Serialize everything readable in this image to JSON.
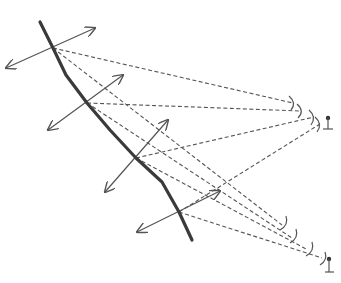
{
  "diagram": {
    "type": "ray-diagram",
    "colors": {
      "surface": "#3a3a3a",
      "rays": "#555555",
      "background": "#ffffff"
    },
    "surface": {
      "points": [
        [
          40,
          22
        ],
        [
          53,
          48
        ],
        [
          66,
          75
        ],
        [
          87,
          103
        ],
        [
          110,
          130
        ],
        [
          136,
          158
        ],
        [
          162,
          182
        ],
        [
          179,
          212
        ],
        [
          192,
          240
        ]
      ]
    },
    "source_points": [
      {
        "id": "p1",
        "x": 53,
        "y": 48,
        "arrow_a": [
          95,
          28
        ],
        "arrow_b": [
          6,
          68
        ]
      },
      {
        "id": "p2",
        "x": 87,
        "y": 103,
        "arrow_a": [
          123,
          75
        ],
        "arrow_b": [
          48,
          130
        ]
      },
      {
        "id": "p3",
        "x": 136,
        "y": 158,
        "arrow_a": [
          168,
          120
        ],
        "arrow_b": [
          105,
          192
        ]
      },
      {
        "id": "p4",
        "x": 179,
        "y": 212,
        "arrow_a": [
          220,
          191
        ],
        "arrow_b": [
          137,
          232
        ]
      }
    ],
    "receivers": [
      {
        "id": "r1",
        "x": 328,
        "y": 118
      },
      {
        "id": "r2",
        "x": 329,
        "y": 259
      }
    ]
  }
}
